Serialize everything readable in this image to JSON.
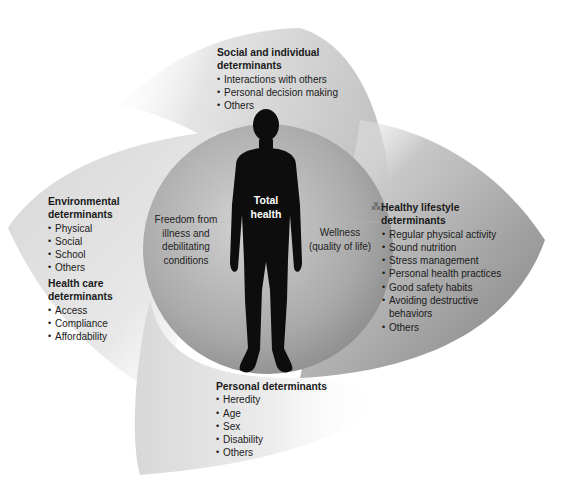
{
  "diagram": {
    "center": {
      "title_line1": "Total",
      "title_line2": "health",
      "left_label": [
        "Freedom from",
        "illness and",
        "debilitating",
        "conditions"
      ],
      "right_label": [
        "Wellness",
        "(quality of life)"
      ]
    },
    "determinants": {
      "social": {
        "title_line1": "Social and individual",
        "title_line2": "determinants",
        "items": [
          "Interactions with others",
          "Personal decision making",
          "Others"
        ]
      },
      "environmental": {
        "title_line1": "Environmental",
        "title_line2": "determinants",
        "items": [
          "Physical",
          "Social",
          "School",
          "Others"
        ]
      },
      "health_care": {
        "title_line1": "Health care",
        "title_line2": "determinants",
        "items": [
          "Access",
          "Compliance",
          "Affordability"
        ]
      },
      "lifestyle": {
        "title_line1": "Healthy lifestyle",
        "title_line2": "determinants",
        "items": [
          "Regular physical activity",
          "Sound nutrition",
          "Stress management",
          "Personal health practices",
          "Good safety habits",
          "Avoiding destructive",
          "behaviors",
          "Others"
        ]
      },
      "personal": {
        "title_line1": "Personal determinants",
        "items": [
          "Heredity",
          "Age",
          "Sex",
          "Disability",
          "Others"
        ]
      }
    },
    "icons": {
      "lifestyle_mark": "⁂"
    },
    "colors": {
      "silhouette": "#0d0d0d",
      "circle_light": "#c9c9c9",
      "circle_dark": "#8f8f8f",
      "blade_light": "#e6e6e6",
      "blade_mid": "#bdbdbd",
      "blade_dark": "#8a8a8a"
    }
  }
}
